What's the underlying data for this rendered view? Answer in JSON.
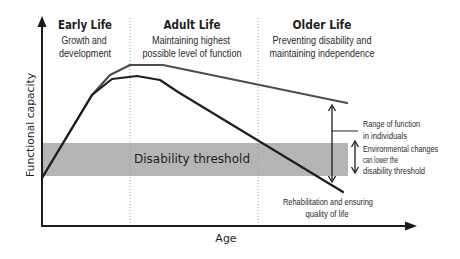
{
  "colors": {
    "background": "#ffffff",
    "threshold_band": "#b5b5b5",
    "upper_curve": "#4d4d4d",
    "lower_curve": "#1e1e1e",
    "axis": "#1a1a1a",
    "divider": "#9a9a9a",
    "text": "#1e1e1e"
  },
  "axes": {
    "y_label": "Functional capacity",
    "x_label": "Age"
  },
  "phases": [
    {
      "title": "Early Life",
      "line1": "Growth and",
      "line2": "development"
    },
    {
      "title": "Adult Life",
      "line1": "Maintaining highest",
      "line2": "possible level of function"
    },
    {
      "title": "Older Life",
      "line1": "Preventing disability and",
      "line2": "maintaining independence"
    }
  ],
  "threshold": {
    "label": "Disability threshold"
  },
  "annotations": {
    "range": {
      "line1": "Range of function",
      "line2": "in individuals"
    },
    "environment": {
      "line1": "Environmental changes",
      "line2": "can lower the",
      "line3": "disability threshold"
    },
    "rehab": {
      "line1": "Rehabilitation and ensuring",
      "line2": "quality of life"
    }
  },
  "curves": {
    "upper": {
      "name": "maintained function",
      "points": "42,178 92,95 110,75 130,65 163,65 347,103"
    },
    "lower": {
      "name": "declining function",
      "points": "42,178 92,95 112,79 137,76 160,80 178,92 343,192"
    }
  }
}
